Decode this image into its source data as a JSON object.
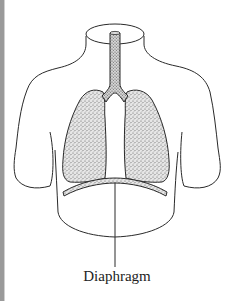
{
  "figure": {
    "labels": {
      "diaphragm": "Diaphragm"
    },
    "colors": {
      "outline": "#2a2a2a",
      "stipple": "#6a6a6a",
      "left_edge": "#9a9a9a"
    }
  }
}
